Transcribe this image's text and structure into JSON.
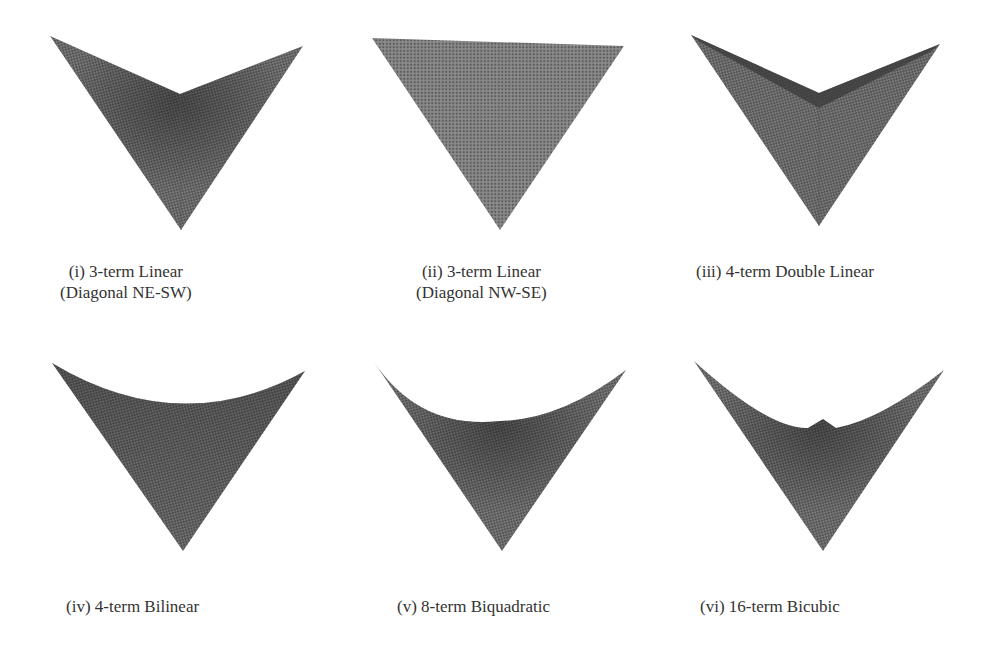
{
  "figure": {
    "panels": [
      {
        "id": "i",
        "caption_line1": "(i) 3-term Linear",
        "caption_line2": "(Diagonal NE-SW)",
        "shape": "v-fold-diagonal-ne-sw"
      },
      {
        "id": "ii",
        "caption_line1": "(ii) 3-term Linear",
        "caption_line2": "(Diagonal NW-SE)",
        "shape": "flat-triangle"
      },
      {
        "id": "iii",
        "caption_line1": "(iii) 4-term Double Linear",
        "caption_line2": "",
        "shape": "v-fold-double-linear"
      },
      {
        "id": "iv",
        "caption_line1": "(iv) 4-term Bilinear",
        "caption_line2": "",
        "shape": "curved-saddle"
      },
      {
        "id": "v",
        "caption_line1": "(v) 8-term Biquadratic",
        "caption_line2": "",
        "shape": "curved-saddle-deep"
      },
      {
        "id": "vi",
        "caption_line1": "(vi) 16-term Bicubic",
        "caption_line2": "",
        "shape": "curved-saddle-bump"
      }
    ],
    "colors": {
      "mesh_dark": "#3a3a3a",
      "mesh_mid": "#6e6e6e",
      "mesh_light": "#8a8a8a"
    }
  }
}
